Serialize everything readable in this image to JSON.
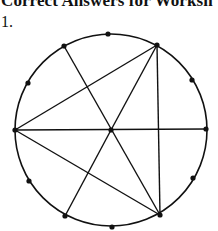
{
  "document": {
    "title": "Correct Answers for Worksh",
    "item_number": "1."
  },
  "figure": {
    "circle": {
      "cx": 111,
      "cy": 130,
      "r": 96
    },
    "points": [
      {
        "name": "top",
        "x": 108,
        "y": 34
      },
      {
        "name": "upper-right",
        "x": 157,
        "y": 45
      },
      {
        "name": "right-upper-side",
        "x": 192,
        "y": 80
      },
      {
        "name": "right",
        "x": 206,
        "y": 129
      },
      {
        "name": "right-lower-side",
        "x": 193,
        "y": 178
      },
      {
        "name": "lower-right",
        "x": 160,
        "y": 215
      },
      {
        "name": "bottom",
        "x": 112,
        "y": 227
      },
      {
        "name": "lower-left",
        "x": 65,
        "y": 216
      },
      {
        "name": "left-lower-side",
        "x": 29,
        "y": 181
      },
      {
        "name": "left",
        "x": 15,
        "y": 130
      },
      {
        "name": "left-upper-side",
        "x": 28,
        "y": 83
      },
      {
        "name": "upper-left",
        "x": 64,
        "y": 46
      },
      {
        "name": "center",
        "x": 111,
        "y": 130
      }
    ],
    "lines": [
      {
        "from": "left",
        "to": "upper-right"
      },
      {
        "from": "upper-right",
        "to": "center"
      },
      {
        "from": "upper-right",
        "to": "lower-right"
      },
      {
        "from": "upper-left",
        "to": "lower-right"
      },
      {
        "from": "left",
        "to": "right"
      },
      {
        "from": "left",
        "to": "lower-right"
      },
      {
        "from": "center",
        "to": "lower-left"
      }
    ],
    "stroke_color": "#111111"
  }
}
